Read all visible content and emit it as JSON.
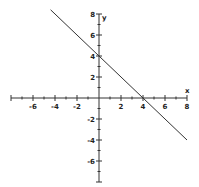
{
  "chart_data": {
    "type": "line",
    "title": "",
    "xlabel": "x",
    "ylabel": "y",
    "xlim": [
      -8,
      8
    ],
    "ylim": [
      -8,
      8
    ],
    "grid": false,
    "x_tick_labels": [
      "-6",
      "-4",
      "-2",
      "2",
      "4",
      "6",
      "8"
    ],
    "y_tick_labels": [
      "8",
      "6",
      "4",
      "2",
      "-2",
      "-4",
      "-6"
    ],
    "series": [
      {
        "name": "y = -x + 4",
        "equation": "y = -x + 4",
        "x": [
          -4.4,
          8
        ],
        "y": [
          8.4,
          -4
        ],
        "color": "#333333"
      }
    ],
    "points_marked": [
      {
        "x": 0,
        "y": 4
      },
      {
        "x": 4,
        "y": 0
      }
    ]
  },
  "labels": {
    "x_axis": "x",
    "y_axis": "y"
  }
}
